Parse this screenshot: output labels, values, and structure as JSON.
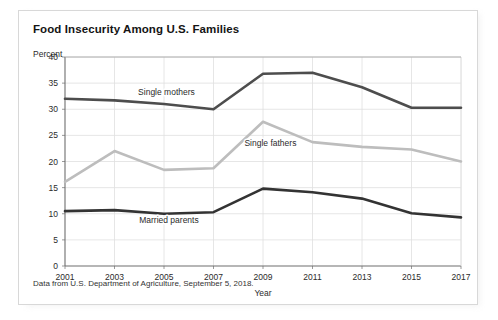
{
  "card": {
    "title": "Food Insecurity Among U.S. Families",
    "footnote": "Data from U.S. Department of Agriculture, September 5, 2018."
  },
  "chart_data": {
    "type": "line",
    "title": "Food Insecurity Among U.S. Families",
    "xlabel": "Year",
    "ylabel": "Percent",
    "x": [
      2001,
      2003,
      2005,
      2007,
      2009,
      2011,
      2013,
      2015,
      2017
    ],
    "xtick_labels": [
      "2001",
      "2003",
      "2005",
      "2007",
      "2009",
      "2011",
      "2013",
      "2015",
      "2017"
    ],
    "ytick_labels": [
      "0",
      "5",
      "10",
      "15",
      "20",
      "25",
      "30",
      "35",
      "40"
    ],
    "ytick_values": [
      0,
      5,
      10,
      15,
      20,
      25,
      30,
      35,
      40
    ],
    "xlim": [
      2001,
      2017
    ],
    "ylim": [
      0,
      40
    ],
    "grid": true,
    "legend_position": "inline-annotations",
    "series": [
      {
        "name": "Single mothers",
        "color": "#4d4d4d",
        "values": [
          32.0,
          31.7,
          31.0,
          30.0,
          36.8,
          37.0,
          34.2,
          30.3,
          30.3
        ],
        "label": "Single mothers",
        "label_x": 2005.1,
        "label_y": 32.8
      },
      {
        "name": "Single fathers",
        "color": "#bdbdbd",
        "values": [
          16.1,
          22.0,
          18.4,
          18.7,
          27.6,
          23.7,
          22.8,
          22.3,
          20.0
        ],
        "label": "Single fathers",
        "label_x": 2009.3,
        "label_y": 23.0
      },
      {
        "name": "Married parents",
        "color": "#333333",
        "values": [
          10.5,
          10.7,
          10.0,
          10.3,
          14.8,
          14.1,
          12.9,
          10.1,
          9.3
        ],
        "label": "Married parents",
        "label_x": 2005.2,
        "label_y": 8.2
      }
    ]
  }
}
